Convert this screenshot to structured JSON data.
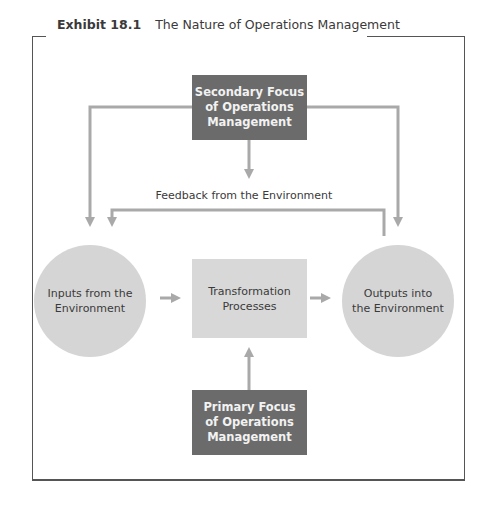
{
  "exhibit": {
    "number": "Exhibit 18.1",
    "title": "The Nature of Operations Management"
  },
  "nodes": {
    "secondary_focus": [
      "Secondary Focus",
      "of Operations",
      "Management"
    ],
    "primary_focus": [
      "Primary Focus",
      "of Operations",
      "Management"
    ],
    "inputs": [
      "Inputs from the",
      "Environment"
    ],
    "transformation": [
      "Transformation",
      "Processes"
    ],
    "outputs": [
      "Outputs into",
      "the Environment"
    ]
  },
  "labels": {
    "feedback": "Feedback from the Environment"
  },
  "colors": {
    "dark_box": "#6b6b6b",
    "light_fill": "#d8d8d8",
    "arrow": "#a9a9a9",
    "frame": "#555555"
  }
}
